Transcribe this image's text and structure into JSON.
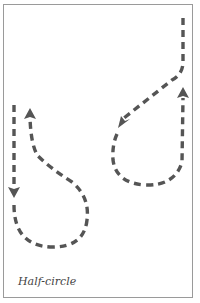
{
  "figure": {
    "caption": "Half-circle",
    "stroke_color": "#555555",
    "border_color": "#9a9a9a",
    "paths": [
      {
        "name": "right-half-circle-path",
        "arrows": [
          "down-left",
          "up"
        ]
      },
      {
        "name": "left-half-circle-path",
        "arrows": [
          "down",
          "up"
        ]
      }
    ]
  }
}
